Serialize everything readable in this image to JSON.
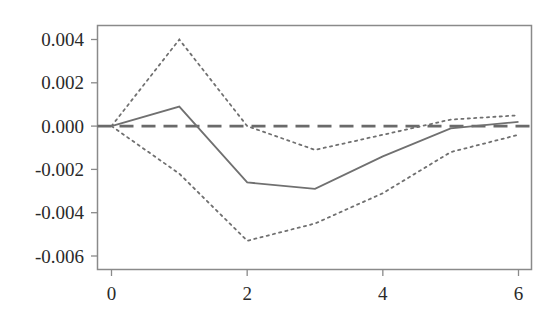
{
  "chart_data": {
    "type": "line",
    "title": "",
    "xlabel": "",
    "ylabel": "",
    "x": [
      0,
      1,
      2,
      3,
      4,
      5,
      6
    ],
    "xlim": [
      -0.2,
      6.2
    ],
    "ylim": [
      -0.0066,
      0.0046
    ],
    "xticks": [
      0,
      2,
      4,
      6
    ],
    "xtick_labels": [
      "0",
      "2",
      "4",
      "6"
    ],
    "yticks": [
      0.004,
      0.002,
      0.0,
      -0.002,
      -0.004,
      -0.006
    ],
    "ytick_labels": [
      "0.004",
      "0.002",
      "0.000",
      "-0.002",
      "-0.004",
      "-0.006"
    ],
    "grid": false,
    "legend": null,
    "series": [
      {
        "name": "response",
        "style": "solid",
        "color": "#707070",
        "values": [
          0.0,
          0.0009,
          -0.0026,
          -0.0029,
          -0.0014,
          -0.0001,
          0.0002
        ]
      },
      {
        "name": "upper band",
        "style": "dotted",
        "color": "#707070",
        "values": [
          0.0,
          0.004,
          0.0,
          -0.0011,
          -0.0004,
          0.0003,
          0.0005
        ]
      },
      {
        "name": "lower band",
        "style": "dotted",
        "color": "#707070",
        "values": [
          0.0,
          -0.0022,
          -0.0053,
          -0.0045,
          -0.0031,
          -0.0012,
          -0.0004
        ]
      }
    ],
    "reference_line": {
      "y": 0.0,
      "style": "dashed",
      "color": "#6a6a6a"
    }
  }
}
